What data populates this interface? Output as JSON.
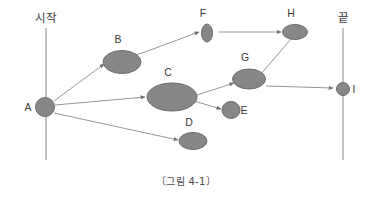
{
  "figure": {
    "caption": "〔그림 4-1〕",
    "background_color": "#ffffff",
    "node_fill_color": "#878787",
    "node_stroke_color": "#6d6d6d",
    "edge_color": "#8a8a8a",
    "text_color": "#3a3a3a"
  },
  "rails": {
    "start": {
      "label": "시작",
      "label_x": 46,
      "label_y": 22,
      "x": 46,
      "y1": 28,
      "y2": 160
    },
    "end": {
      "label": "끝",
      "label_x": 343,
      "label_y": 22,
      "x": 343,
      "y1": 28,
      "y2": 160
    }
  },
  "nodes": [
    {
      "id": "A",
      "label": "A",
      "shape": "ellipse",
      "cx": 45,
      "cy": 107,
      "rx": 9.5,
      "ry": 9.5,
      "label_x": 28,
      "label_y": 111
    },
    {
      "id": "B",
      "label": "B",
      "shape": "ellipse",
      "cx": 122,
      "cy": 62,
      "rx": 19,
      "ry": 11.5,
      "label_x": 118,
      "label_y": 43
    },
    {
      "id": "C",
      "label": "C",
      "shape": "ellipse",
      "cx": 172,
      "cy": 97,
      "rx": 25,
      "ry": 14,
      "label_x": 168,
      "label_y": 76
    },
    {
      "id": "D",
      "label": "D",
      "shape": "ellipse",
      "cx": 193,
      "cy": 141,
      "rx": 14,
      "ry": 8.5,
      "label_x": 189,
      "label_y": 126
    },
    {
      "id": "E",
      "label": "E",
      "shape": "ellipse",
      "cx": 231,
      "cy": 110,
      "rx": 9,
      "ry": 8.5,
      "label_x": 244,
      "label_y": 114
    },
    {
      "id": "F",
      "label": "F",
      "shape": "ellipse",
      "cx": 207,
      "cy": 33,
      "rx": 5.5,
      "ry": 9,
      "label_x": 203,
      "label_y": 17
    },
    {
      "id": "G",
      "label": "G",
      "shape": "ellipse",
      "cx": 249,
      "cy": 79,
      "rx": 16.5,
      "ry": 10,
      "label_x": 245,
      "label_y": 61
    },
    {
      "id": "H",
      "label": "H",
      "shape": "ellipse",
      "cx": 295,
      "cy": 32,
      "rx": 12.5,
      "ry": 7.5,
      "label_x": 291,
      "label_y": 17
    },
    {
      "id": "I",
      "label": "I",
      "shape": "ellipse",
      "cx": 343,
      "cy": 89,
      "rx": 6.5,
      "ry": 6.5,
      "label_x": 354,
      "label_y": 93
    }
  ],
  "edges": [
    {
      "from": "A",
      "to": "B",
      "x1": 54,
      "y1": 101,
      "x2": 104,
      "y2": 64,
      "arrow": true
    },
    {
      "from": "A",
      "to": "C",
      "x1": 55,
      "y1": 105,
      "x2": 145,
      "y2": 97,
      "arrow": true
    },
    {
      "from": "A",
      "to": "D",
      "x1": 54,
      "y1": 113,
      "x2": 178,
      "y2": 140,
      "arrow": true
    },
    {
      "from": "B",
      "to": "F",
      "x1": 134,
      "y1": 56,
      "x2": 199,
      "y2": 32,
      "arrow": true
    },
    {
      "from": "C",
      "to": "G",
      "x1": 197,
      "y1": 95,
      "x2": 234,
      "y2": 83,
      "arrow": true
    },
    {
      "from": "C",
      "to": "E",
      "x1": 194,
      "y1": 101,
      "x2": 221,
      "y2": 109,
      "arrow": true
    },
    {
      "from": "F",
      "to": "H",
      "x1": 219,
      "y1": 32,
      "x2": 281,
      "y2": 32,
      "arrow": true
    },
    {
      "from": "G",
      "to": "H",
      "x1": 261,
      "y1": 74,
      "x2": 291,
      "y2": 39,
      "arrow": false
    },
    {
      "from": "G",
      "to": "I",
      "x1": 266,
      "y1": 86,
      "x2": 333,
      "y2": 88,
      "arrow": true
    }
  ],
  "caption_position": {
    "x": 186,
    "y": 185
  }
}
